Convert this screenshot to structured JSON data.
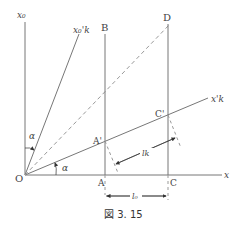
{
  "figure": {
    "caption": "図 3. 15",
    "colors": {
      "line": "#777777",
      "dashed": "#999999",
      "text": "#444444"
    },
    "points": {
      "origin": "O",
      "A": "A",
      "A_prime": "A'",
      "B": "B",
      "C": "C",
      "C_prime": "C'",
      "D": "D"
    },
    "axes": {
      "x": "x",
      "x0": "x₀",
      "x_prime_k": "x'k",
      "x0_prime_k": "x₀'k"
    },
    "angles": {
      "alpha_top": "α",
      "alpha_bottom": "α"
    },
    "dimensions": {
      "l0": "l₀",
      "lk": "lk"
    }
  }
}
